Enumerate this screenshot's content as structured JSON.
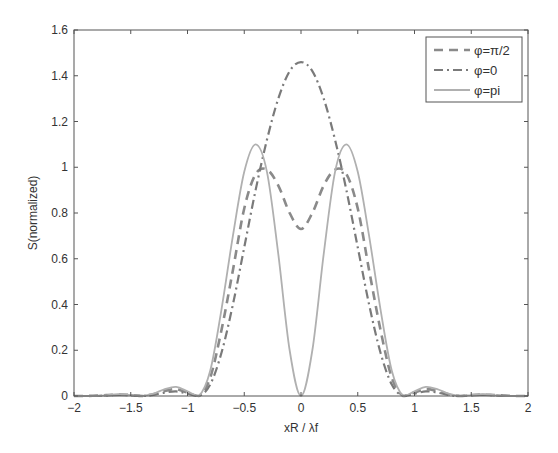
{
  "chart_data": {
    "type": "line",
    "title": "",
    "xlabel": "xR / λf",
    "ylabel": "S(normalized)",
    "xlim": [
      -2,
      2
    ],
    "ylim": [
      0,
      1.6
    ],
    "xticks": [
      -2,
      -1.5,
      -1,
      -0.5,
      0,
      0.5,
      1,
      1.5,
      2
    ],
    "xtick_labels": [
      "-2",
      "-1.5",
      "-1",
      "-0.5",
      "0",
      "0.5",
      "1",
      "1.5",
      "2"
    ],
    "yticks": [
      0,
      0.2,
      0.4,
      0.6,
      0.8,
      1,
      1.2,
      1.4,
      1.6
    ],
    "ytick_labels": [
      "0",
      "0.2",
      "0.4",
      "0.6",
      "0.8",
      "1",
      "1.2",
      "1.4",
      "1.6"
    ],
    "grid": false,
    "legend_position": "upper right",
    "x": [
      -2.0,
      -1.9,
      -1.8,
      -1.7,
      -1.6,
      -1.5,
      -1.4,
      -1.3,
      -1.2,
      -1.1,
      -1.0,
      -0.9,
      -0.8,
      -0.7,
      -0.6,
      -0.5,
      -0.4,
      -0.3,
      -0.2,
      -0.1,
      0.0,
      0.1,
      0.2,
      0.3,
      0.4,
      0.5,
      0.6,
      0.7,
      0.8,
      0.9,
      1.0,
      1.1,
      1.2,
      1.3,
      1.4,
      1.5,
      1.6,
      1.7,
      1.8,
      1.9,
      2.0
    ],
    "series": [
      {
        "name": "φ=π/2",
        "style": "dashed",
        "color": "#8a8a8a",
        "values": [
          0,
          0,
          0.002,
          0.004,
          0.006,
          0.004,
          0,
          0.008,
          0.022,
          0.03,
          0.015,
          0,
          0.08,
          0.29,
          0.55,
          0.82,
          0.97,
          0.99,
          0.92,
          0.8,
          0.73,
          0.8,
          0.92,
          0.99,
          0.97,
          0.82,
          0.55,
          0.29,
          0.08,
          0,
          0.015,
          0.03,
          0.022,
          0.008,
          0,
          0.004,
          0.006,
          0.004,
          0.002,
          0,
          0
        ]
      },
      {
        "name": "φ=0",
        "style": "dashdot",
        "color": "#7a7a7a",
        "values": [
          0,
          0,
          0,
          0.003,
          0.005,
          0.003,
          0,
          0.005,
          0.015,
          0.02,
          0.01,
          0,
          0.05,
          0.19,
          0.4,
          0.65,
          0.9,
          1.12,
          1.3,
          1.42,
          1.46,
          1.42,
          1.3,
          1.12,
          0.9,
          0.65,
          0.4,
          0.19,
          0.05,
          0,
          0.01,
          0.02,
          0.015,
          0.005,
          0,
          0.003,
          0.005,
          0.003,
          0,
          0,
          0
        ]
      },
      {
        "name": "φ=pi",
        "style": "solid",
        "color": "#b0b0b0",
        "values": [
          0,
          0,
          0,
          0.004,
          0.008,
          0.004,
          0,
          0.01,
          0.03,
          0.04,
          0.02,
          0,
          0.11,
          0.38,
          0.7,
          0.98,
          1.1,
          0.98,
          0.62,
          0.2,
          0,
          0.2,
          0.62,
          0.98,
          1.1,
          0.98,
          0.7,
          0.38,
          0.11,
          0,
          0.02,
          0.04,
          0.03,
          0.01,
          0,
          0.004,
          0.008,
          0.004,
          0,
          0,
          0
        ]
      }
    ]
  },
  "legend": {
    "items": [
      {
        "label": "φ=π/2",
        "style": "dashed"
      },
      {
        "label": "φ=0",
        "style": "dashdot"
      },
      {
        "label": "φ=pi",
        "style": "solid"
      }
    ]
  }
}
